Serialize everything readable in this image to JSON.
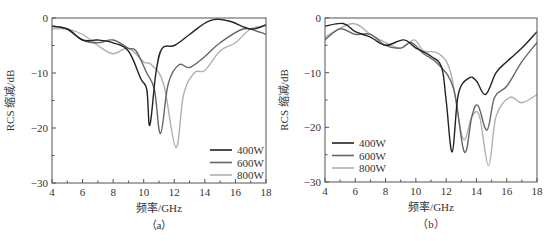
{
  "chart_data": [
    {
      "type": "line",
      "panel_label": "（a）",
      "title": "",
      "xlabel": "频率/GHz",
      "ylabel": "RCS 缩减/dB",
      "xlim": [
        4,
        18
      ],
      "ylim": [
        -30,
        0
      ],
      "xticks": [
        4,
        6,
        8,
        10,
        12,
        14,
        16,
        18
      ],
      "yticks": [
        0,
        -10,
        -20,
        -30
      ],
      "grid": false,
      "legend_position": "lower right",
      "series": [
        {
          "name": "400W",
          "color": "#222222",
          "x": [
            4,
            5,
            6,
            7,
            8,
            9,
            9.8,
            10.2,
            10.4,
            10.8,
            11.2,
            12,
            13,
            14.3,
            15.5,
            17,
            18
          ],
          "y": [
            -1.5,
            -2,
            -4,
            -4,
            -4.5,
            -6,
            -11,
            -13,
            -19.5,
            -10,
            -5.5,
            -5,
            -3,
            -0.5,
            -0.5,
            -2,
            -1.2
          ]
        },
        {
          "name": "600W",
          "color": "#666666",
          "x": [
            4,
            5,
            6,
            7,
            8,
            9,
            9.5,
            10.2,
            10.7,
            11.1,
            11.6,
            12.3,
            13,
            14,
            15,
            16.5,
            17.5,
            18
          ],
          "y": [
            -1.5,
            -2,
            -4,
            -4.5,
            -4,
            -5.5,
            -6,
            -10,
            -13,
            -21,
            -12,
            -8.5,
            -9,
            -7,
            -4.5,
            -2,
            -2.5,
            -3
          ]
        },
        {
          "name": "800W",
          "color": "#b0b0b0",
          "x": [
            4,
            5,
            6,
            7,
            8,
            9,
            10,
            10.5,
            11.3,
            12.1,
            12.6,
            13.3,
            14,
            15,
            16,
            17,
            18
          ],
          "y": [
            -2,
            -2,
            -3,
            -5,
            -6.5,
            -5.5,
            -8,
            -8.5,
            -12,
            -23.5,
            -14,
            -10,
            -9.5,
            -6,
            -4.5,
            -2,
            -1.5
          ]
        }
      ]
    },
    {
      "type": "line",
      "panel_label": "（b）",
      "title": "",
      "xlabel": "频率/GHz",
      "ylabel": "RCS 缩减/dB",
      "xlim": [
        4,
        18
      ],
      "ylim": [
        -30,
        0
      ],
      "xticks": [
        4,
        6,
        8,
        10,
        12,
        14,
        16,
        18
      ],
      "yticks": [
        0,
        -10,
        -20,
        -30
      ],
      "grid": false,
      "legend_position": "lower left",
      "series": [
        {
          "name": "400W",
          "color": "#222222",
          "x": [
            4,
            5.2,
            6,
            7,
            8,
            9.2,
            10,
            11,
            11.7,
            12,
            12.4,
            12.8,
            13.5,
            14,
            14.6,
            15.3,
            16,
            17,
            18
          ],
          "y": [
            -1.5,
            -1,
            -2.5,
            -3.5,
            -5,
            -4,
            -5.5,
            -7,
            -9,
            -15,
            -24.5,
            -14,
            -11,
            -11.5,
            -14,
            -10,
            -8,
            -5.5,
            -2.5
          ]
        },
        {
          "name": "600W",
          "color": "#666666",
          "x": [
            4,
            5,
            6,
            7,
            8,
            9,
            9.7,
            10.5,
            11.5,
            12.5,
            13.2,
            13.7,
            14.1,
            14.7,
            15.2,
            16,
            17,
            18
          ],
          "y": [
            -4,
            -2,
            -3,
            -3,
            -5,
            -5.5,
            -4.5,
            -6.5,
            -8.5,
            -13,
            -24.5,
            -18,
            -16,
            -20.5,
            -14.5,
            -12.5,
            -8,
            -4.5
          ]
        },
        {
          "name": "800W",
          "color": "#b0b0b0",
          "x": [
            4,
            5.8,
            7,
            8,
            9,
            9.9,
            10.5,
            11.5,
            12.3,
            13.1,
            13.7,
            14.2,
            14.8,
            15.3,
            16.2,
            17,
            18
          ],
          "y": [
            -3.5,
            -1,
            -3,
            -4.5,
            -5.5,
            -4,
            -6,
            -6.5,
            -10,
            -22,
            -18,
            -18,
            -27,
            -18,
            -14.5,
            -15.5,
            -14
          ]
        }
      ]
    }
  ]
}
